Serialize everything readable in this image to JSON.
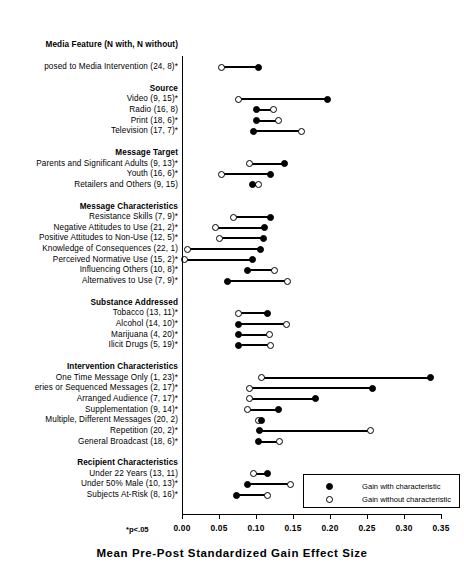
{
  "chart_data": {
    "type": "bar",
    "title": "",
    "column_header": "Media Feature (N with, N without)",
    "xlabel": "Mean Pre-Post Standardized Gain Effect Size",
    "ylabel": "",
    "xlim": [
      0.0,
      0.35
    ],
    "xticks": [
      0.0,
      0.05,
      0.1,
      0.15,
      0.2,
      0.25,
      0.3,
      0.35
    ],
    "xtick_labels": [
      "0.00",
      "0.05",
      "0.10",
      "0.15",
      "0.20",
      "0.25",
      "0.30",
      "0.35"
    ],
    "grid": false,
    "legend_position": "lower-right",
    "footnote": "*p<.05",
    "legend": [
      {
        "marker": "filled-circle",
        "label": "Gain with characteristic"
      },
      {
        "marker": "open-circle",
        "label": "Gain without characteristic"
      }
    ],
    "series": [
      {
        "name": "Gain with characteristic",
        "marker": "filled-circle"
      },
      {
        "name": "Gain without characteristic",
        "marker": "open-circle"
      }
    ],
    "rows": [
      {
        "kind": "row",
        "label": "posed to Media Intervention (24, 8)*",
        "with": 0.104,
        "without": 0.054
      },
      {
        "kind": "group",
        "label": "Source"
      },
      {
        "kind": "row",
        "label": "Video (9, 15)*",
        "with": 0.196,
        "without": 0.077
      },
      {
        "kind": "row",
        "label": "Radio (16, 8)",
        "with": 0.1,
        "without": 0.123
      },
      {
        "kind": "row",
        "label": "Print (18, 6)*",
        "with": 0.1,
        "without": 0.13
      },
      {
        "kind": "row",
        "label": "Television (17, 7)*",
        "with": 0.096,
        "without": 0.162
      },
      {
        "kind": "group",
        "label": "Message Target"
      },
      {
        "kind": "row",
        "label": "Parents and Significant Adults (9, 13)*",
        "with": 0.138,
        "without": 0.091
      },
      {
        "kind": "row",
        "label": "Youth (16, 6)*",
        "with": 0.119,
        "without": 0.054
      },
      {
        "kind": "row",
        "label": "Retailers and Others (9, 15)",
        "with": 0.095,
        "without": 0.104
      },
      {
        "kind": "group",
        "label": "Message Characteristics"
      },
      {
        "kind": "row",
        "label": "Resistance Skills (7, 9)*",
        "with": 0.12,
        "without": 0.069
      },
      {
        "kind": "row",
        "label": "Negative Attitudes to Use (21, 2)*",
        "with": 0.112,
        "without": 0.045
      },
      {
        "kind": "row",
        "label": "Positive Attitudes to Non-Use (12, 5)*",
        "with": 0.11,
        "without": 0.051
      },
      {
        "kind": "row",
        "label": "Knowledge of Consequences (22, 1)",
        "with": 0.106,
        "without": 0.007
      },
      {
        "kind": "row",
        "label": "Perceived Normative Use (15, 2)*",
        "with": 0.095,
        "without": 0.003
      },
      {
        "kind": "row",
        "label": "Influencing Others (10, 8)*",
        "with": 0.089,
        "without": 0.125
      },
      {
        "kind": "row",
        "label": "Alternatives to Use (7, 9)*",
        "with": 0.062,
        "without": 0.142
      },
      {
        "kind": "group",
        "label": "Substance Addressed"
      },
      {
        "kind": "row",
        "label": "Tobacco (13, 11)*",
        "with": 0.115,
        "without": 0.077
      },
      {
        "kind": "row",
        "label": "Alcohol (14, 10)*",
        "with": 0.077,
        "without": 0.141
      },
      {
        "kind": "row",
        "label": "Marijuana (4, 20)*",
        "with": 0.077,
        "without": 0.118
      },
      {
        "kind": "row",
        "label": "Ilicit Drugs (5, 19)*",
        "with": 0.077,
        "without": 0.119
      },
      {
        "kind": "group",
        "label": "Intervention Characteristics"
      },
      {
        "kind": "row",
        "label": "One Time Message Only (1, 23)*",
        "with": 0.336,
        "without": 0.107
      },
      {
        "kind": "row",
        "label": "eries or Sequenced Messages (2, 17)*",
        "with": 0.258,
        "without": 0.091
      },
      {
        "kind": "row",
        "label": "Arranged Audience (7, 17)*",
        "with": 0.181,
        "without": 0.091
      },
      {
        "kind": "row",
        "label": "Supplementation (9, 14)*",
        "with": 0.131,
        "without": 0.089
      },
      {
        "kind": "row",
        "label": "Multiple, Different Messages (20, 2)",
        "with": 0.107,
        "without": 0.103
      },
      {
        "kind": "row",
        "label": "Repetition (20, 2)*",
        "with": 0.105,
        "without": 0.255
      },
      {
        "kind": "row",
        "label": "General Broadcast (18, 6)*",
        "with": 0.103,
        "without": 0.132
      },
      {
        "kind": "group",
        "label": "Recipient Characteristics"
      },
      {
        "kind": "row",
        "label": "Under 22 Years (13, 11)",
        "with": 0.115,
        "without": 0.097
      },
      {
        "kind": "row",
        "label": "Under 50% Male (10, 13)*",
        "with": 0.089,
        "without": 0.147
      },
      {
        "kind": "row",
        "label": "Subjects At-Risk (8, 16)*",
        "with": 0.074,
        "without": 0.116
      }
    ]
  }
}
